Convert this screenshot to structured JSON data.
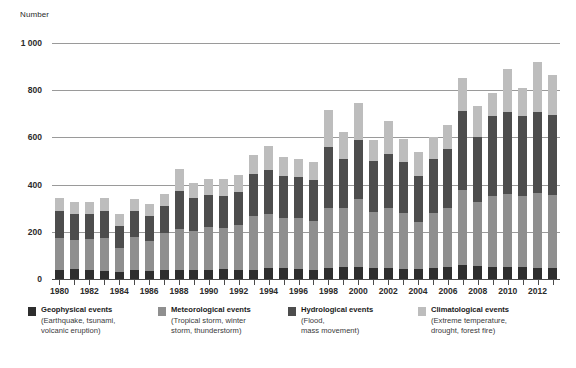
{
  "chart_data": {
    "type": "bar",
    "title": "",
    "subtitle": "",
    "xlabel": "",
    "ylabel": "Number",
    "ylim": [
      0,
      1000
    ],
    "yticks": [
      0,
      200,
      400,
      600,
      800,
      1000
    ],
    "ytick_labels": [
      "0",
      "200",
      "400",
      "600",
      "800",
      "1 000"
    ],
    "grid": true,
    "stacked": true,
    "legend_position": "bottom",
    "categories": [
      1980,
      1981,
      1982,
      1983,
      1984,
      1985,
      1986,
      1987,
      1988,
      1989,
      1990,
      1991,
      1992,
      1993,
      1994,
      1995,
      1996,
      1997,
      1998,
      1999,
      2000,
      2001,
      2002,
      2003,
      2004,
      2005,
      2006,
      2007,
      2008,
      2009,
      2010,
      2011,
      2012,
      2013
    ],
    "xtick_labels": [
      "1980",
      "1982",
      "1984",
      "1986",
      "1988",
      "1990",
      "1992",
      "1994",
      "1996",
      "1998",
      "2000",
      "2002",
      "2004",
      "2006",
      "2008",
      "2010",
      "2012"
    ],
    "series": [
      {
        "name": "Geophysical events",
        "color": "#2e2e2e",
        "values": [
          38,
          42,
          38,
          32,
          28,
          40,
          35,
          40,
          38,
          38,
          40,
          42,
          40,
          40,
          45,
          48,
          42,
          40,
          48,
          50,
          52,
          45,
          48,
          44,
          42,
          48,
          52,
          58,
          55,
          50,
          52,
          50,
          48,
          48
        ]
      },
      {
        "name": "Meteorological events",
        "color": "#8f8f8f",
        "values": [
          135,
          125,
          130,
          140,
          105,
          140,
          128,
          155,
          175,
          165,
          180,
          175,
          190,
          225,
          230,
          210,
          215,
          205,
          255,
          250,
          285,
          240,
          255,
          235,
          200,
          230,
          250,
          320,
          270,
          300,
          310,
          300,
          315,
          310
        ]
      },
      {
        "name": "Hydrological events",
        "color": "#4d4d4d",
        "values": [
          115,
          110,
          108,
          115,
          90,
          110,
          105,
          115,
          160,
          140,
          135,
          135,
          140,
          180,
          185,
          180,
          175,
          175,
          255,
          210,
          250,
          215,
          225,
          215,
          195,
          230,
          250,
          335,
          275,
          340,
          345,
          340,
          345,
          335
        ]
      },
      {
        "name": "Climatological events",
        "color": "#bdbdbd",
        "values": [
          55,
          48,
          52,
          58,
          52,
          48,
          52,
          52,
          95,
          62,
          68,
          70,
          70,
          80,
          105,
          80,
          78,
          75,
          160,
          115,
          160,
          90,
          140,
          100,
          100,
          95,
          100,
          140,
          135,
          100,
          185,
          120,
          210,
          170
        ]
      }
    ],
    "totals": [
      343,
      325,
      328,
      345,
      275,
      338,
      320,
      362,
      468,
      405,
      423,
      422,
      440,
      525,
      565,
      518,
      510,
      495,
      718,
      625,
      747,
      590,
      668,
      594,
      537,
      603,
      652,
      853,
      735,
      790,
      892,
      810,
      918,
      863
    ]
  },
  "legend": {
    "items": [
      {
        "title": "Geophysical events",
        "sub1": "(Earthquake, tsunami,",
        "sub2": "volcanic eruption)",
        "swatch_name": "legend-swatch-geophysical"
      },
      {
        "title": "Meteorological events",
        "sub1": "(Tropical storm, winter",
        "sub2": "storm, thunderstorm)",
        "swatch_name": "legend-swatch-meteorological"
      },
      {
        "title": "Hydrological events",
        "sub1": "(Flood,",
        "sub2": "mass movement)",
        "swatch_name": "legend-swatch-hydrological"
      },
      {
        "title": "Climatological events",
        "sub1": "(Extreme temperature,",
        "sub2": "drought, forest fire)",
        "swatch_name": "legend-swatch-climatological"
      }
    ]
  },
  "colors": {
    "geophysical": "#2e2e2e",
    "meteorological": "#8f8f8f",
    "hydrological": "#4d4d4d",
    "climatological": "#bdbdbd",
    "gridline": "#9a9a9a",
    "axis": "#4a4a4a"
  }
}
